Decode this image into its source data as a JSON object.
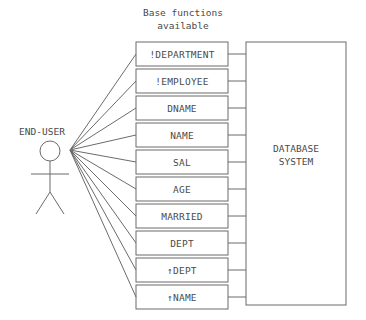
{
  "diagram": {
    "title": "Base functions\navailable",
    "actor": {
      "label": "END-USER",
      "icon": "stick-figure-actor-icon"
    },
    "system": {
      "label": "DATABASE\nSYSTEM"
    },
    "functions": [
      {
        "label": "!DEPARTMENT"
      },
      {
        "label": "!EMPLOYEE"
      },
      {
        "label": "DNAME"
      },
      {
        "label": "NAME"
      },
      {
        "label": "SAL"
      },
      {
        "label": "AGE"
      },
      {
        "label": "MARRIED"
      },
      {
        "label": "DEPT"
      },
      {
        "label": "↑DEPT"
      },
      {
        "label": "↑NAME"
      }
    ],
    "colors": {
      "background": "#ffffff",
      "stroke": "#6b6b6b",
      "text": "#4a4a4a"
    }
  }
}
